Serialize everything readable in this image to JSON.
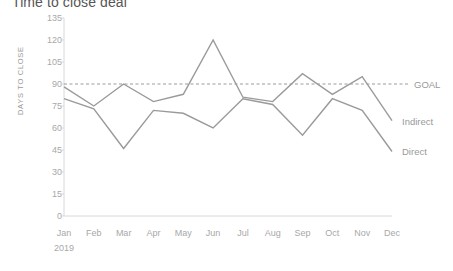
{
  "chart_data": {
    "type": "line",
    "title": "Time to close deal",
    "xlabel": "2019",
    "ylabel": "DAYS TO CLOSE",
    "categories": [
      "Jan",
      "Feb",
      "Mar",
      "Apr",
      "May",
      "Jun",
      "Jul",
      "Aug",
      "Sep",
      "Oct",
      "Nov",
      "Dec"
    ],
    "ylim": [
      0,
      135
    ],
    "yticks": [
      135,
      120,
      105,
      90,
      75,
      60,
      45,
      30,
      15,
      0
    ],
    "grid": false,
    "legend_position": "right",
    "series": [
      {
        "name": "Indirect",
        "color": "#9a9a9a",
        "style": "solid",
        "values": [
          88,
          75,
          90,
          78,
          83,
          120,
          81,
          78,
          97,
          83,
          95,
          65
        ]
      },
      {
        "name": "Direct",
        "color": "#9a9a9a",
        "style": "solid",
        "values": [
          80,
          73,
          46,
          72,
          70,
          60,
          80,
          76,
          55,
          80,
          72,
          44
        ]
      },
      {
        "name": "GOAL",
        "color": "#9a9a9a",
        "style": "dashed",
        "constant": 90,
        "values": [
          90,
          90,
          90,
          90,
          90,
          90,
          90,
          90,
          90,
          90,
          90,
          90
        ]
      }
    ],
    "annotations": {
      "goal_label": "GOAL",
      "indirect_label": "Indirect",
      "direct_label": "Direct"
    }
  },
  "colors": {
    "line": "#9a9a9a",
    "axis": "#d8d8d8",
    "tick_text": "#a8a8a8",
    "title_text": "#555555"
  }
}
